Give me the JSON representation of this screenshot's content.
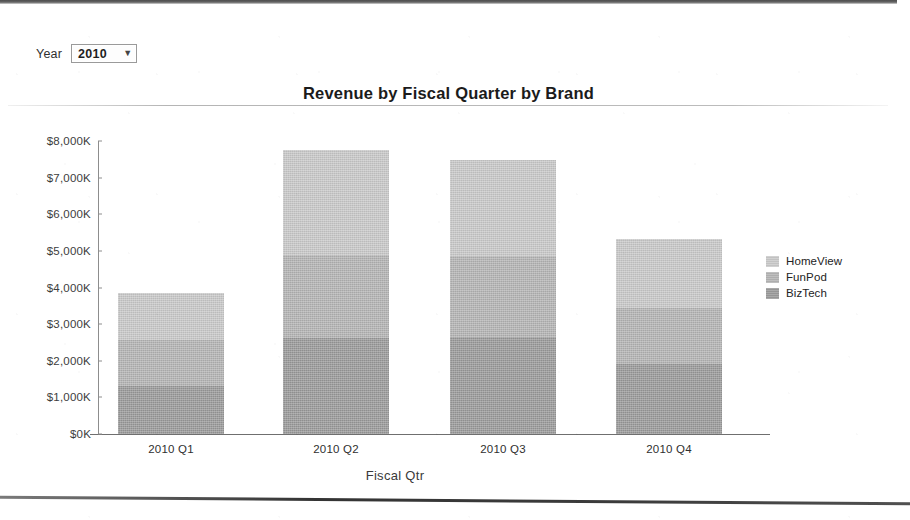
{
  "controls": {
    "year_label": "Year",
    "year_value": "2010",
    "caret_icon": "chevron-down-icon",
    "year_options": [
      "2010"
    ]
  },
  "axis": {
    "x_title": "Fiscal Qtr",
    "y_ticks": [
      "$8,000K",
      "$7,000K",
      "$6,000K",
      "$5,000K",
      "$4,000K",
      "$3,000K",
      "$2,000K",
      "$1,000K",
      "$0K"
    ]
  },
  "chart_data": {
    "type": "bar",
    "subtype": "stacked-vertical",
    "title": "Revenue by Fiscal Quarter by Brand",
    "xlabel": "Fiscal Qtr",
    "ylabel": "",
    "categories": [
      "2010 Q1",
      "2010 Q2",
      "2010 Q3",
      "2010 Q4"
    ],
    "ylim": [
      0,
      8000
    ],
    "y_tick_step": 1000,
    "y_tick_labels": [
      "$0K",
      "$1,000K",
      "$2,000K",
      "$3,000K",
      "$4,000K",
      "$5,000K",
      "$6,000K",
      "$7,000K",
      "$8,000K"
    ],
    "value_unit": "thousands of dollars (K)",
    "grid": false,
    "legend_position": "right",
    "stack_order_bottom_to_top": [
      "BizTech",
      "FunPod",
      "HomeView"
    ],
    "series": [
      {
        "name": "HomeView",
        "color": "#c9c9c9",
        "values": [
          1280,
          2865,
          2615,
          1885
        ]
      },
      {
        "name": "FunPod",
        "color": "#b4b4b4",
        "values": [
          1255,
          2270,
          2210,
          1530
        ]
      },
      {
        "name": "BizTech",
        "color": "#9a9a9a",
        "values": [
          1310,
          2620,
          2650,
          1910
        ]
      }
    ],
    "totals": [
      3845,
      7755,
      7475,
      5325
    ]
  },
  "legend": {
    "items": [
      {
        "label": "HomeView",
        "color": "#c9c9c9"
      },
      {
        "label": "FunPod",
        "color": "#b4b4b4"
      },
      {
        "label": "BizTech",
        "color": "#9a9a9a"
      }
    ]
  }
}
